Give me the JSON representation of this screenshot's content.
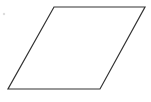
{
  "diagram": {
    "shape": "parallelogram",
    "stroke_color": "#333333",
    "fill_color": "#ffffff",
    "stroke_width": 1.2,
    "points": [
      [
        54,
        7
      ],
      [
        145,
        7
      ],
      [
        100,
        89
      ],
      [
        8,
        89
      ]
    ],
    "marker": {
      "x": 4,
      "y": 14,
      "color": "#dddddd"
    }
  }
}
